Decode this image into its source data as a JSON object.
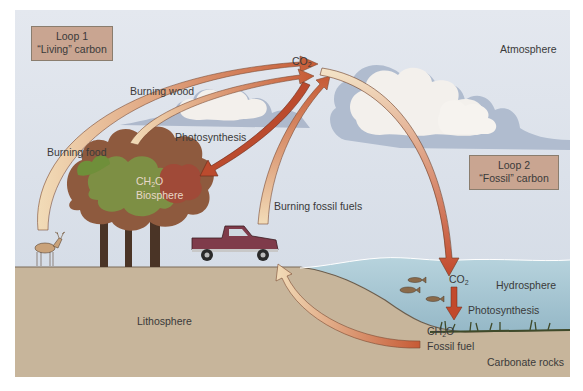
{
  "loops": [
    {
      "line1": "Loop 1",
      "line2": "“Living” carbon"
    },
    {
      "line1": "Loop 2",
      "line2": "“Fossil” carbon"
    }
  ],
  "spheres": {
    "atmosphere": "Atmosphere",
    "hydrosphere": "Hydrosphere",
    "lithosphere": "Lithosphere",
    "biosphere": "Biosphere",
    "carbonate_rocks": "Carbonate rocks"
  },
  "labels": {
    "co2_main": "CO",
    "co2_main_sub": "2",
    "co2_water": "CO",
    "co2_water_sub": "2",
    "burning_wood": "Burning wood",
    "burning_food": "Burning food",
    "photosynthesis_land": "Photosynthesis",
    "burning_fossil_fuels": "Burning fossil fuels",
    "photosynthesis_water": "Photosynthesis",
    "ch2o_bio": "CH",
    "ch2o_bio_sub": "2",
    "ch2o_bio_end": "O",
    "ch2o_fossil": "CH",
    "ch2o_fossil_sub": "2",
    "ch2o_fossil_end": "O",
    "fossil_fuel": "Fossil fuel"
  },
  "colors": {
    "sky": "#dde3ec",
    "cloud": "#f4f1ee",
    "cloud_shadow": "#a9b6cc",
    "ground": "#c9b99f",
    "water": "#a9c9d6",
    "arrow_orange": "#e0894a",
    "arrow_red": "#b8452e",
    "arrow_pale": "#f3e2c4",
    "tree_green": "#6f8f3a",
    "tree_red": "#a8503a",
    "trunk": "#4a3426",
    "truck": "#7f3b4a",
    "loop_box": "#c9a591"
  }
}
